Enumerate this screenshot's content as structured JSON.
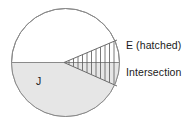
{
  "figure": {
    "kind": "set-diagram",
    "width": 188,
    "height": 127,
    "background_color": "#ffffff"
  },
  "labels": {
    "set_j": "J",
    "set_e": "E (hatched)",
    "intersection": "Intersection"
  },
  "shapes": {
    "universe_circle": {
      "name": "sample-space-circle",
      "center_x": 65.5,
      "center_y": 62.5,
      "radius": 54,
      "stroke_color": "#8a8a8a",
      "fill_color": "#ffffff",
      "stroke_width": 1
    },
    "set_j_region": {
      "name": "lower-half-disc",
      "description": "lower half of circle, shaded",
      "fill_color": "#e6e6e6",
      "stroke_color": "#8a8a8a"
    },
    "set_e_region": {
      "name": "hatched-wedge",
      "description": "triangular wedge, apex at circle center, opening right",
      "apex_x": 64,
      "apex_y": 62.5,
      "top_right_x": 117,
      "top_right_y": 40,
      "bottom_right_x": 117,
      "bottom_right_y": 86,
      "hatch_color": "#555555",
      "hatch_line_count": 11,
      "hatch_orientation": "vertical"
    },
    "intersection_region": {
      "name": "wedge-lower-half",
      "description": "overlap of hatched wedge and shaded lower half",
      "fill_color": "#e0e0e0"
    },
    "diameter_line": {
      "name": "horizontal-diameter",
      "y": 62.5,
      "x1": 11.5,
      "x2": 119.5,
      "stroke_color": "#8a8a8a"
    }
  },
  "leader_lines": {
    "e_pointer_visible": false,
    "intersection_pointer_visible": false
  }
}
